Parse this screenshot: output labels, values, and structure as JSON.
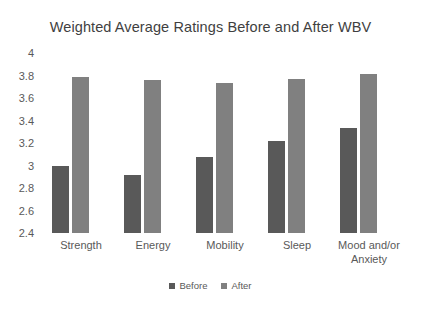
{
  "chart_data": {
    "type": "bar",
    "title": "Weighted Average Ratings Before and After WBV",
    "xlabel": "",
    "ylabel": "",
    "categories": [
      "Strength",
      "Energy",
      "Mobility",
      "Sleep",
      "Mood and/or Anxiety"
    ],
    "category_lines": [
      [
        "Strength"
      ],
      [
        "Energy"
      ],
      [
        "Mobility"
      ],
      [
        "Sleep"
      ],
      [
        "Mood and/or",
        "Anxiety"
      ]
    ],
    "series": [
      {
        "name": "Before",
        "color": "#595959",
        "values": [
          3.0,
          2.92,
          3.08,
          3.22,
          3.33
        ]
      },
      {
        "name": "After",
        "color": "#808080",
        "values": [
          3.79,
          3.76,
          3.73,
          3.77,
          3.81
        ]
      }
    ],
    "ylim": [
      2.4,
      4
    ],
    "yticks": [
      4,
      3.8,
      3.6,
      3.4,
      3.2,
      3,
      2.8,
      2.6,
      2.4
    ],
    "ytick_labels": [
      "4",
      "3.8",
      "3.6",
      "3.4",
      "3.2",
      "3",
      "2.8",
      "2.6",
      "2.4"
    ],
    "grid": false,
    "legend_position": "bottom"
  },
  "legend": {
    "items": [
      {
        "label": "Before",
        "color": "#595959"
      },
      {
        "label": "After",
        "color": "#808080"
      }
    ]
  },
  "colors": {
    "background": "#ffffff",
    "text": "#595959",
    "title": "#3f3f3f",
    "series_before": "#595959",
    "series_after": "#808080"
  }
}
